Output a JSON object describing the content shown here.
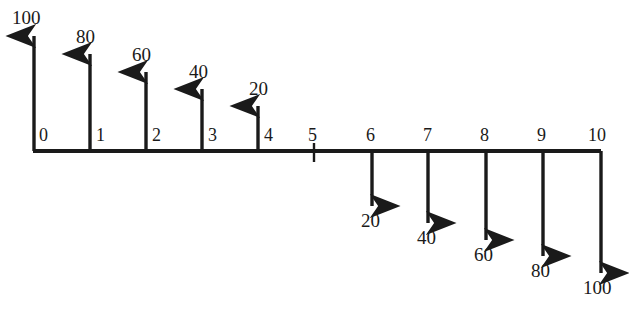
{
  "figure": {
    "title": "",
    "axis": {
      "name": "horizontal-axis",
      "tick_labels": [
        "0",
        "1",
        "2",
        "3",
        "4",
        "5",
        "6",
        "7",
        "8",
        "9",
        "10"
      ],
      "x_start_px": 33,
      "x_end_px": 601,
      "y_px": 151,
      "stroke_color": "#1a1a1a",
      "stroke_width": 4
    },
    "arrows_up": [
      {
        "name": "arrow-up-100",
        "position": "0",
        "value_label": "100",
        "x_px": 34,
        "tip_y_px": 36,
        "label_x_px": 12,
        "label_y_px": 8
      },
      {
        "name": "arrow-up-80",
        "position": "1",
        "value_label": "80",
        "x_px": 90,
        "tip_y_px": 54,
        "label_x_px": 76,
        "label_y_px": 27
      },
      {
        "name": "arrow-up-60",
        "position": "2",
        "value_label": "60",
        "x_px": 146,
        "tip_y_px": 72,
        "label_x_px": 132,
        "label_y_px": 45
      },
      {
        "name": "arrow-up-40",
        "position": "3",
        "value_label": "40",
        "x_px": 202,
        "tip_y_px": 89,
        "label_x_px": 189,
        "label_y_px": 62
      },
      {
        "name": "arrow-up-20",
        "position": "4",
        "value_label": "20",
        "x_px": 258,
        "tip_y_px": 106,
        "label_x_px": 249,
        "label_y_px": 79
      }
    ],
    "tick_mark": {
      "name": "tick-mark-5",
      "position": "5",
      "x_px": 314,
      "top_y_px": 143,
      "bottom_y_px": 162
    },
    "arrows_down": [
      {
        "name": "arrow-down-20",
        "position": "6",
        "value_label": "20",
        "x_px": 372,
        "tip_y_px": 206,
        "label_x_px": 361,
        "label_y_px": 211
      },
      {
        "name": "arrow-down-40",
        "position": "7",
        "value_label": "40",
        "x_px": 428,
        "tip_y_px": 223,
        "label_x_px": 417,
        "label_y_px": 228
      },
      {
        "name": "arrow-down-60",
        "position": "8",
        "value_label": "60",
        "x_px": 486,
        "tip_y_px": 240,
        "label_x_px": 474,
        "label_y_px": 245
      },
      {
        "name": "arrow-down-80",
        "position": "9",
        "value_label": "80",
        "x_px": 543,
        "tip_y_px": 256,
        "label_x_px": 531,
        "label_y_px": 261
      },
      {
        "name": "arrow-down-100",
        "position": "10",
        "value_label": "100",
        "x_px": 601,
        "tip_y_px": 273,
        "label_x_px": 583,
        "label_y_px": 278
      }
    ],
    "axis_labels": [
      {
        "name": "axis-label-0",
        "text": "0",
        "x_px": 39,
        "y_px": 126
      },
      {
        "name": "axis-label-1",
        "text": "1",
        "x_px": 96,
        "y_px": 126
      },
      {
        "name": "axis-label-2",
        "text": "2",
        "x_px": 152,
        "y_px": 126
      },
      {
        "name": "axis-label-3",
        "text": "3",
        "x_px": 208,
        "y_px": 126
      },
      {
        "name": "axis-label-4",
        "text": "4",
        "x_px": 264,
        "y_px": 126
      },
      {
        "name": "axis-label-5",
        "text": "5",
        "x_px": 308,
        "y_px": 126
      },
      {
        "name": "axis-label-6",
        "text": "6",
        "x_px": 366,
        "y_px": 126
      },
      {
        "name": "axis-label-7",
        "text": "7",
        "x_px": 423,
        "y_px": 126
      },
      {
        "name": "axis-label-8",
        "text": "8",
        "x_px": 480,
        "y_px": 126
      },
      {
        "name": "axis-label-9",
        "text": "9",
        "x_px": 537,
        "y_px": 126
      },
      {
        "name": "axis-label-10",
        "text": "10",
        "x_px": 588,
        "y_px": 126
      }
    ]
  },
  "chart_data": {
    "type": "bar",
    "title": "",
    "xlabel": "",
    "ylabel": "",
    "categories": [
      "0",
      "1",
      "2",
      "3",
      "4",
      "5",
      "6",
      "7",
      "8",
      "9",
      "10"
    ],
    "values": [
      100,
      80,
      60,
      40,
      20,
      0,
      -20,
      -40,
      -60,
      -80,
      -100
    ],
    "value_labels": [
      "100",
      "80",
      "60",
      "40",
      "20",
      "",
      "20",
      "40",
      "60",
      "80",
      "100"
    ],
    "directions": [
      "up",
      "up",
      "up",
      "up",
      "up",
      "none",
      "down",
      "down",
      "down",
      "down",
      "down"
    ],
    "ylim": [
      -100,
      100
    ],
    "grid": false,
    "legend": null
  },
  "style": {
    "line_color": "#1a1a1a",
    "background_color": "#ffffff",
    "text_color": "#1a1a1a"
  }
}
